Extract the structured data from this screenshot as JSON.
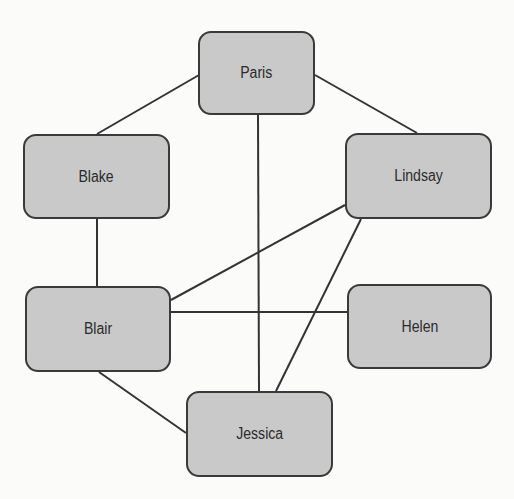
{
  "diagram": {
    "type": "undirected-graph",
    "colors": {
      "background": "#fbfbfa",
      "node_fill": "#c9c9c9",
      "node_border": "#3a3a3a",
      "edge": "#333333",
      "text": "#2b2b2b"
    },
    "nodes": [
      {
        "id": "paris",
        "label": "Paris",
        "x": 198,
        "y": 31,
        "w": 117,
        "h": 84
      },
      {
        "id": "blake",
        "label": "Blake",
        "x": 23,
        "y": 134,
        "w": 147,
        "h": 85
      },
      {
        "id": "lindsay",
        "label": "Lindsay",
        "x": 345,
        "y": 133,
        "w": 147,
        "h": 86
      },
      {
        "id": "blair",
        "label": "Blair",
        "x": 25,
        "y": 286,
        "w": 146,
        "h": 86
      },
      {
        "id": "helen",
        "label": "Helen",
        "x": 347,
        "y": 284,
        "w": 145,
        "h": 85
      },
      {
        "id": "jessica",
        "label": "Jessica",
        "x": 186,
        "y": 391,
        "w": 147,
        "h": 86
      }
    ],
    "edges": [
      {
        "from": "paris",
        "to": "blake",
        "x1": 199,
        "y1": 75,
        "x2": 97,
        "y2": 134
      },
      {
        "from": "paris",
        "to": "lindsay",
        "x1": 315,
        "y1": 75,
        "x2": 417,
        "y2": 133
      },
      {
        "from": "paris",
        "to": "jessica",
        "x1": 258,
        "y1": 115,
        "x2": 259,
        "y2": 391
      },
      {
        "from": "blake",
        "to": "blair",
        "x1": 97,
        "y1": 219,
        "x2": 97,
        "y2": 286
      },
      {
        "from": "lindsay",
        "to": "blair",
        "x1": 345,
        "y1": 205,
        "x2": 171,
        "y2": 300
      },
      {
        "from": "lindsay",
        "to": "jessica",
        "x1": 361,
        "y1": 219,
        "x2": 276,
        "y2": 391
      },
      {
        "from": "blair",
        "to": "helen",
        "x1": 171,
        "y1": 312,
        "x2": 347,
        "y2": 312
      },
      {
        "from": "blair",
        "to": "jessica",
        "x1": 99,
        "y1": 372,
        "x2": 186,
        "y2": 433
      }
    ]
  }
}
